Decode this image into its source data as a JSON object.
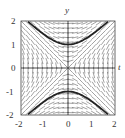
{
  "diagram": {
    "type": "slope_field",
    "equation_hint": "dy/dt = t/y",
    "axes": {
      "x_label": "t",
      "y_label": "y",
      "x_range": [
        -2,
        2
      ],
      "y_range": [
        -2,
        2
      ],
      "x_ticks": [
        "-2",
        "-1",
        "0",
        "1",
        "2"
      ],
      "y_ticks": [
        "2",
        "1",
        "0",
        "-1",
        "-2"
      ]
    },
    "solution_curves": [
      {
        "name": "upper-hyperbola",
        "formula": "y = sqrt(1 + t^2)",
        "t_range": [
          -1.7,
          1.7
        ]
      },
      {
        "name": "lower-hyperbola",
        "formula": "y = -sqrt(1 + t^2)",
        "t_range": [
          -1.7,
          1.7
        ]
      }
    ],
    "colors": {
      "field": "#555555",
      "curve": "#222222",
      "axis": "#333333",
      "frame": "#444444"
    }
  }
}
